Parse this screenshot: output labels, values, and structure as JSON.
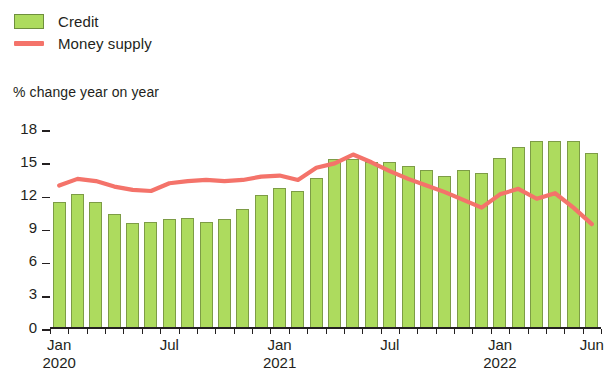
{
  "legend": {
    "items": [
      {
        "label": "Credit",
        "type": "bar",
        "color": "#addb5e"
      },
      {
        "label": "Money supply",
        "type": "line",
        "color": "#f4736a"
      }
    ]
  },
  "axis_title": "% change year on year",
  "chart_data": {
    "type": "bar",
    "title": "",
    "subtitle": "",
    "xlabel": "",
    "ylabel": "% change year on year",
    "ylim": [
      0,
      18
    ],
    "yticks": [
      0,
      3,
      6,
      9,
      12,
      15,
      18
    ],
    "grid": false,
    "legend_position": "top-left",
    "x": [
      "Jan 2020",
      "Feb 2020",
      "Mar 2020",
      "Apr 2020",
      "May 2020",
      "Jun 2020",
      "Jul 2020",
      "Aug 2020",
      "Sep 2020",
      "Oct 2020",
      "Nov 2020",
      "Dec 2020",
      "Jan 2021",
      "Feb 2021",
      "Mar 2021",
      "Apr 2021",
      "May 2021",
      "Jun 2021",
      "Jul 2021",
      "Aug 2021",
      "Sep 2021",
      "Oct 2021",
      "Nov 2021",
      "Dec 2021",
      "Jan 2022",
      "Feb 2022",
      "Mar 2022",
      "Apr 2022",
      "May 2022",
      "Jun 2022"
    ],
    "tick_labels": [
      {
        "index": 0,
        "month": "Jan",
        "year": "2020"
      },
      {
        "index": 6,
        "month": "Jul",
        "year": ""
      },
      {
        "index": 12,
        "month": "Jan",
        "year": "2021"
      },
      {
        "index": 18,
        "month": "Jul",
        "year": ""
      },
      {
        "index": 24,
        "month": "Jan",
        "year": "2022"
      },
      {
        "index": 29,
        "month": "Jun",
        "year": ""
      }
    ],
    "series": [
      {
        "name": "Credit",
        "type": "bar",
        "color": "#addb5e",
        "values": [
          11.3,
          12.0,
          11.3,
          10.2,
          9.4,
          9.5,
          9.8,
          9.9,
          9.5,
          9.8,
          10.7,
          11.9,
          12.6,
          12.3,
          13.5,
          15.2,
          15.2,
          14.9,
          14.9,
          14.6,
          14.2,
          13.7,
          14.2,
          13.9,
          15.3,
          16.3,
          16.8,
          16.8,
          16.8,
          15.7
        ]
      },
      {
        "name": "Money supply",
        "type": "line",
        "color": "#f4736a",
        "values": [
          12.8,
          13.4,
          13.2,
          12.7,
          12.4,
          12.3,
          13.0,
          13.2,
          13.3,
          13.2,
          13.3,
          13.6,
          13.7,
          13.3,
          14.4,
          14.8,
          15.6,
          14.9,
          14.1,
          13.4,
          12.8,
          12.2,
          11.5,
          10.8,
          12.0,
          12.5,
          11.6,
          12.1,
          10.8,
          9.3
        ]
      }
    ]
  }
}
